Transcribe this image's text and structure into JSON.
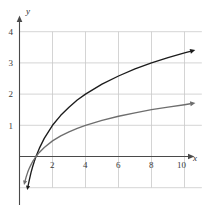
{
  "figure": {
    "width": 204,
    "height": 208,
    "background": "#ffffff"
  },
  "axes": {
    "x_name": "x",
    "y_name": "y",
    "grid_color": "#c9c9c9",
    "axis_color": "#4a4a4a",
    "x_ticks": [
      "2",
      "4",
      "6",
      "8",
      "10"
    ],
    "y_ticks": [
      "1",
      "2",
      "3",
      "4"
    ]
  },
  "curves": {
    "upper_color": "#1c1c1c",
    "lower_color": "#6e6e6e"
  },
  "chart_data": {
    "type": "line",
    "title": "",
    "subtitle": "",
    "xlabel": "x",
    "ylabel": "y",
    "xlim": [
      -0.2,
      11.2
    ],
    "ylim": [
      -1.2,
      4.4
    ],
    "grid": true,
    "legend": null,
    "x_ticks": [
      2,
      4,
      6,
      8,
      10
    ],
    "y_ticks": [
      1,
      2,
      3,
      4
    ],
    "x_tick_labels": [
      "2",
      "4",
      "6",
      "8",
      "10"
    ],
    "y_tick_labels": [
      "1",
      "2",
      "3",
      "4"
    ],
    "annotations": [
      "both curves pass through (1, 0)",
      "each curve ends in an arrowhead at the right",
      "each curve begins with a downward arrowhead near y = -1"
    ],
    "series": [
      {
        "name": "upper curve",
        "color": "#1c1c1c",
        "x": [
          0.52,
          0.6,
          0.7,
          0.8,
          0.9,
          1.0,
          1.2,
          1.5,
          2.0,
          2.5,
          3.0,
          3.5,
          4.0,
          5.0,
          6.0,
          7.0,
          8.0,
          9.0,
          10.0,
          10.35
        ],
        "y": [
          -0.94,
          -0.74,
          -0.51,
          -0.32,
          -0.15,
          0.0,
          0.26,
          0.58,
          1.0,
          1.32,
          1.58,
          1.81,
          2.0,
          2.32,
          2.58,
          2.81,
          3.0,
          3.17,
          3.32,
          3.37
        ]
      },
      {
        "name": "lower curve",
        "color": "#6e6e6e",
        "x": [
          0.34,
          0.4,
          0.5,
          0.6,
          0.7,
          0.8,
          0.9,
          1.0,
          1.2,
          1.5,
          2.0,
          2.5,
          3.0,
          3.5,
          4.0,
          5.0,
          6.0,
          7.0,
          8.0,
          9.0,
          10.0,
          10.35
        ],
        "y": [
          -0.78,
          -0.66,
          -0.5,
          -0.37,
          -0.26,
          -0.16,
          -0.08,
          0.0,
          0.13,
          0.29,
          0.5,
          0.66,
          0.79,
          0.9,
          1.0,
          1.16,
          1.29,
          1.4,
          1.5,
          1.58,
          1.66,
          1.69
        ]
      }
    ]
  }
}
